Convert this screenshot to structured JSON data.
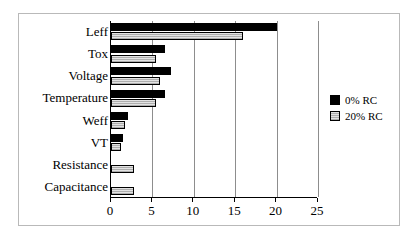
{
  "chart_data": {
    "type": "bar",
    "orientation": "horizontal",
    "title": "",
    "subtitle": "",
    "xlabel": "",
    "ylabel": "",
    "xlim": [
      0,
      25
    ],
    "xticks": [
      0,
      5,
      10,
      15,
      20,
      25
    ],
    "xticklabels": [
      "0",
      "5",
      "10",
      "15",
      "20",
      "25"
    ],
    "grid": "vertical-only",
    "legend_position": "right",
    "categories": [
      "Leff",
      "Tox",
      "Voltage",
      "Temperature",
      "Weff",
      "VT",
      "Resistance",
      "Capacitance"
    ],
    "series": [
      {
        "name": "0% RC",
        "color": "#000000",
        "fill": "solid-black",
        "values": [
          20.0,
          6.5,
          7.2,
          6.5,
          2.0,
          1.5,
          0,
          0
        ]
      },
      {
        "name": "20% RC",
        "color": "#e3e3e3",
        "fill": "light-gray-hatched",
        "values": [
          16.0,
          5.4,
          5.9,
          5.4,
          1.7,
          1.2,
          2.8,
          2.8
        ]
      }
    ]
  },
  "legend": {
    "items": [
      {
        "label": "0% RC"
      },
      {
        "label": "20% RC"
      }
    ]
  },
  "colors": {
    "series_0": "#000000",
    "series_1": "#e3e3e3",
    "axis": "#000000",
    "gridline": "#8d8d8d",
    "frame": "#b9b9b9",
    "background": "#ffffff"
  }
}
